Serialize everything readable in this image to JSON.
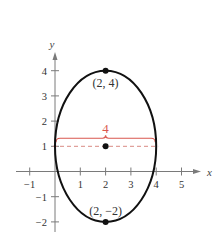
{
  "diagram": {
    "x_axis": {
      "label": "x",
      "range": [
        -1.5,
        5.8
      ],
      "ticks": [
        -1,
        1,
        2,
        3,
        4,
        5
      ],
      "tick_labels": [
        "−1",
        "1",
        "2",
        "3",
        "4",
        "5"
      ]
    },
    "y_axis": {
      "label": "y",
      "range": [
        -2.4,
        5.0
      ],
      "ticks": [
        4,
        3,
        2,
        1,
        -1,
        -2
      ],
      "tick_labels": [
        "4",
        "3",
        "2",
        "1",
        "−1",
        "−2"
      ]
    },
    "ellipse": {
      "center": [
        2,
        1
      ],
      "semi_axis_x": 2,
      "semi_axis_y": 3
    },
    "points": [
      {
        "name": "top-vertex",
        "x": 2,
        "y": 4,
        "label": "(2, 4)"
      },
      {
        "name": "center",
        "x": 2,
        "y": 1,
        "label": ""
      },
      {
        "name": "bottom-vertex",
        "x": 2,
        "y": -2,
        "label": "(2, −2)"
      }
    ],
    "minor_axis_brace": {
      "from": [
        0,
        1
      ],
      "to": [
        4,
        1
      ],
      "label": "4"
    },
    "colors": {
      "accent": "#d9574f",
      "dashed": "#d98a84",
      "curve": "#111111",
      "axis": "#7a7a7a"
    }
  }
}
